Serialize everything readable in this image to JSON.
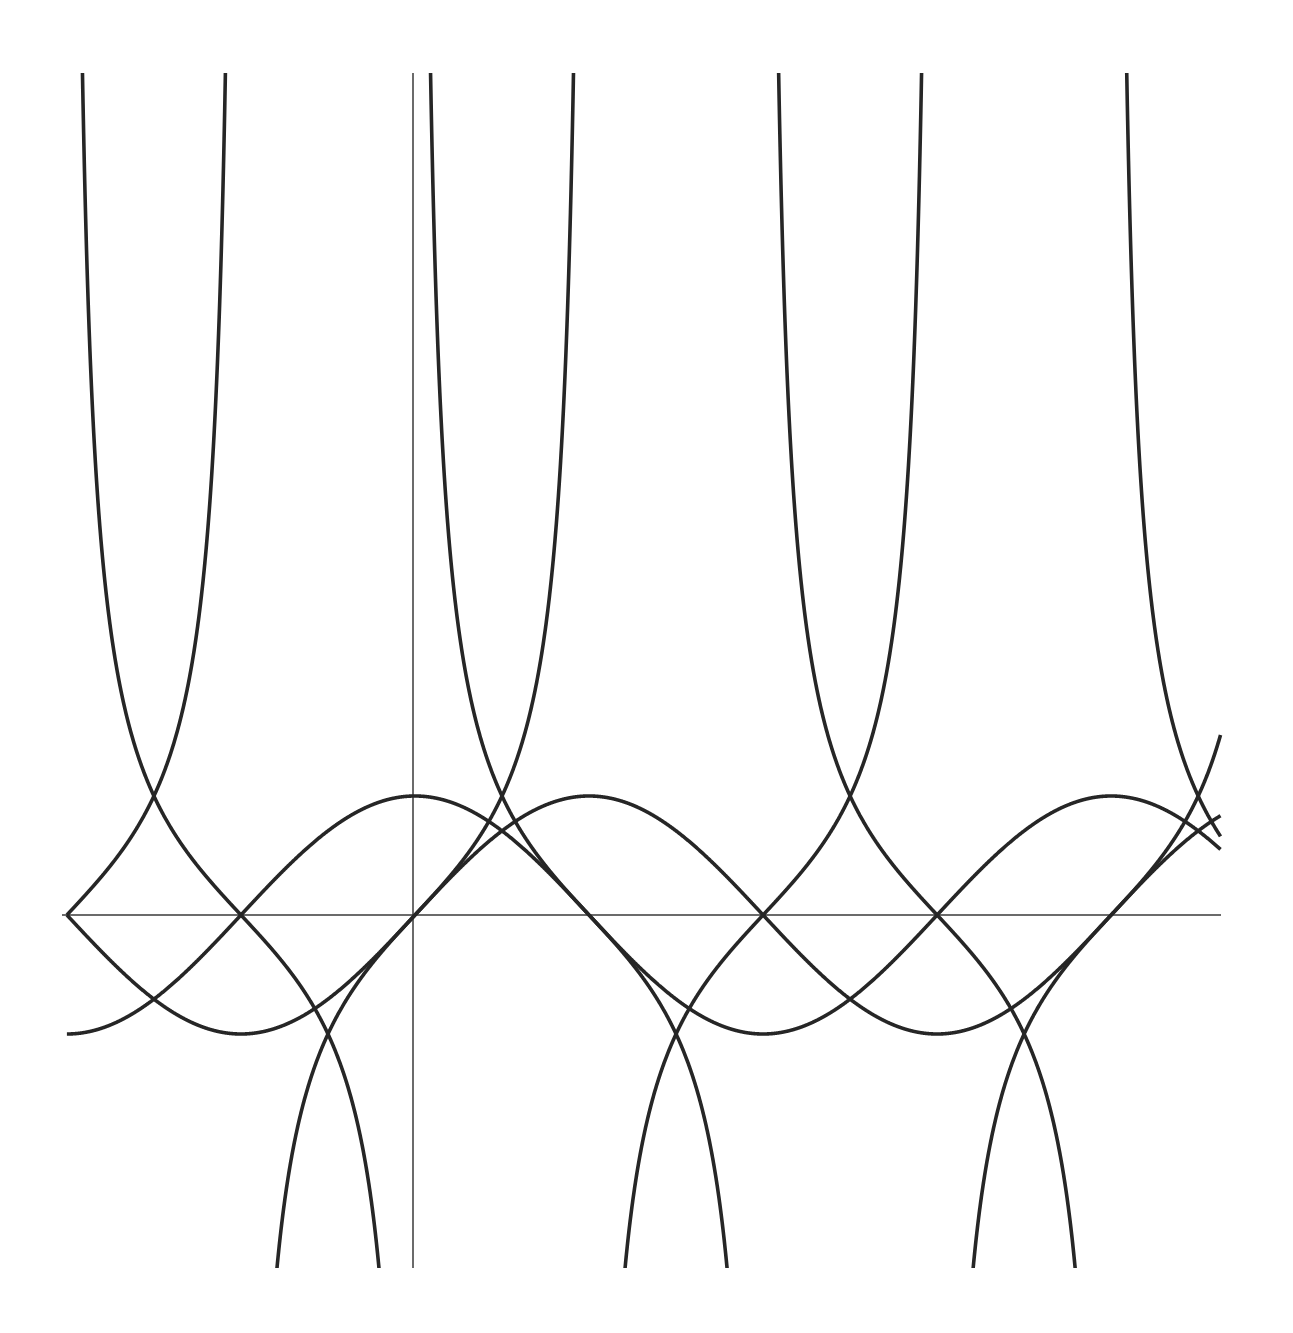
{
  "watermark": {
    "text": ""
  },
  "chart_data": {
    "type": "line",
    "title": "",
    "xlabel": "",
    "ylabel": "",
    "grid": false,
    "legend": null,
    "xlim": [
      -3.19,
      7.27
    ],
    "ylim": [
      -3.0,
      7.1
    ],
    "pixel_mapping": {
      "origin_x": 415,
      "origin_y": 915,
      "x_scale_px_per_unit": 110.8,
      "y_scale_px_per_unit": 119,
      "x_axis_from_px": 62,
      "x_axis_to_px": 1221,
      "y_axis_x_px": 413,
      "y_axis_from_px": 73,
      "y_axis_to_px": 1268,
      "clip_top_px": 73,
      "clip_bottom_px": 1268,
      "curve_x_from": -3.1416,
      "curve_x_to": 7.27
    },
    "colors": {
      "curve": "#262626",
      "axis": "#3a3a3a",
      "background": "#ffffff"
    },
    "series": [
      {
        "name": "y = sin x",
        "fn": "sin",
        "x": [
          -3.1416,
          -1.5708,
          0,
          1.5708,
          3.1416,
          4.7124,
          6.2832,
          7.27
        ],
        "values": [
          0,
          -1,
          0,
          1,
          0,
          -1,
          0,
          0.83
        ]
      },
      {
        "name": "y = cos x",
        "fn": "cos",
        "x": [
          -3.1416,
          -1.5708,
          0,
          1.5708,
          3.1416,
          4.7124,
          6.2832,
          7.27
        ],
        "values": [
          -1,
          0,
          1,
          0,
          -1,
          0,
          1,
          0.55
        ]
      },
      {
        "name": "y = tan x",
        "fn": "tan",
        "x": [
          -3.1416,
          -2.356,
          -1.8,
          -1.27,
          -0.785,
          0,
          0.785,
          1.44,
          2.356,
          3.1416,
          3.927,
          4.58,
          5.5,
          6.2832,
          7.27
        ],
        "values": [
          0,
          1,
          4.29,
          -3.19,
          -1,
          0,
          1,
          7.6,
          -1,
          0,
          1,
          7.6,
          -0.7,
          0,
          1.6
        ],
        "asymptotes": [
          -1.5708,
          1.5708,
          4.7124
        ]
      },
      {
        "name": "y = cot x",
        "fn": "cot",
        "x": [
          -3.09,
          -2.356,
          -1.5708,
          -0.785,
          -0.3,
          0.13,
          0.785,
          1.5708,
          2.356,
          2.84,
          3.27,
          3.927,
          4.7124,
          5.498,
          6.0,
          6.41,
          7.27
        ],
        "values": [
          7.6,
          1,
          0,
          -1,
          -3.2,
          7.6,
          1,
          0,
          -1,
          -3.2,
          7.6,
          1,
          0,
          -1,
          -3.2,
          7.6,
          0.66
        ],
        "asymptotes": [
          -3.1416,
          0,
          3.1416,
          6.2832
        ]
      }
    ]
  }
}
